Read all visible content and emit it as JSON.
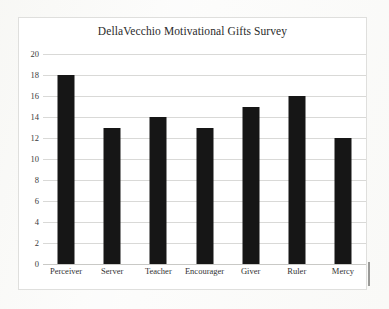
{
  "chart_data": {
    "type": "bar",
    "title": "DellaVecchio Motivational Gifts Survey",
    "xlabel": "",
    "ylabel": "",
    "categories": [
      "Perceiver",
      "Server",
      "Teacher",
      "Encourager",
      "Giver",
      "Ruler",
      "Mercy"
    ],
    "values": [
      18,
      13,
      14,
      13,
      15,
      16,
      12
    ],
    "ylim": [
      0,
      20
    ],
    "ytick_step": 2,
    "yticks": [
      20,
      18,
      16,
      14,
      12,
      10,
      8,
      6,
      4,
      2,
      0
    ],
    "grid": true,
    "legend": false,
    "bar_color": "#161616",
    "grid_color": "#d9d9d7",
    "plot_background": "#ffffff",
    "page_background": "#fbfbfa"
  }
}
